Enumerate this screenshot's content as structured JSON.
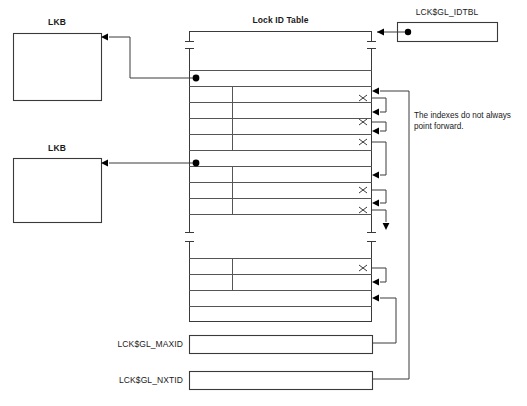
{
  "diagram": {
    "title": "Lock ID Table",
    "type": "memory-structure-diagram",
    "labels": {
      "lkb_top": "LKB",
      "lkb_bottom": "LKB",
      "lock_id_table": "Lock ID Table",
      "idtbl": "LCK$GL_IDTBL",
      "maxid": "LCK$GL_MAXID",
      "nxtid": "LCK$GL_NXTID"
    },
    "annotation": "The indexes do not always\npoint forward.",
    "colors": {
      "line": "#3a3a3a",
      "text": "#1a1a1a",
      "background": "#ffffff"
    },
    "boxes": [
      {
        "name": "lkb-top",
        "label": "LKB",
        "x": 13,
        "y": 33,
        "w": 88,
        "h": 67
      },
      {
        "name": "lkb-bottom",
        "label": "LKB",
        "x": 13,
        "y": 158,
        "w": 88,
        "h": 64
      },
      {
        "name": "idtbl",
        "label": "LCK$GL_IDTBL",
        "x": 397,
        "y": 22,
        "w": 100,
        "h": 19
      },
      {
        "name": "maxid",
        "label": "LCK$GL_MAXID",
        "x": 189,
        "y": 335,
        "w": 183,
        "h": 18
      },
      {
        "name": "nxtid",
        "label": "LCK$GL_NXTID",
        "x": 189,
        "y": 371,
        "w": 183,
        "h": 18
      }
    ],
    "table": {
      "left": 189,
      "right": 372,
      "divider_x": 232,
      "top": 31,
      "bottom": 322,
      "breaks": [
        {
          "y1": 40,
          "y2": 48
        },
        {
          "y1": 232,
          "y2": 241
        }
      ],
      "rows": [
        {
          "y": 70,
          "kind": "pointer-row",
          "marker": "dot"
        },
        {
          "y": 86,
          "kind": "pointer-row",
          "marker": "dot"
        },
        {
          "y": 102,
          "kind": "index-row",
          "marker": "x"
        },
        {
          "y": 118,
          "kind": "index-row",
          "marker": "x"
        },
        {
          "y": 134,
          "kind": "index-row",
          "marker": "x"
        },
        {
          "y": 150,
          "kind": "index-row",
          "marker": "x"
        },
        {
          "y": 166,
          "kind": "pointer-row",
          "marker": "dot"
        },
        {
          "y": 182,
          "kind": "index-row",
          "marker": "x"
        },
        {
          "y": 198,
          "kind": "index-row",
          "marker": "x"
        },
        {
          "y": 214,
          "kind": "index-row",
          "marker": "x"
        },
        {
          "y": 258,
          "kind": "index-row",
          "marker": "x"
        },
        {
          "y": 274,
          "kind": "index-row",
          "marker": "x"
        },
        {
          "y": 290,
          "kind": "index-row",
          "marker": "x"
        },
        {
          "y": 306,
          "kind": "index-row",
          "marker": "x"
        }
      ],
      "index_marker": "x"
    }
  }
}
